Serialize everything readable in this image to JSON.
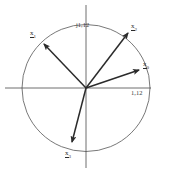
{
  "figure": {
    "type": "vector diagram on unit circle",
    "stroke_color": "#2b2b2b",
    "circle_color": "#555555",
    "axis_color": "#4a4a4a",
    "background": "#ffffff"
  },
  "geometry": {
    "origin": {
      "x": 86,
      "y": 88
    },
    "radius": 64,
    "x_axis": {
      "x1": 5,
      "y1": 88,
      "x2": 151,
      "y2": 88
    },
    "y_axis": {
      "x1": 86,
      "y1": 5,
      "x2": 86,
      "y2": 168
    }
  },
  "axis_labels": {
    "top": "j1,12",
    "right": "1,12"
  },
  "vectors": [
    {
      "id": "x0",
      "symbol": "x",
      "subscript": "0",
      "tip": {
        "x": 139,
        "y": 70
      },
      "label_pos": {
        "x": 143,
        "y": 61
      },
      "angle_deg": 18.8,
      "length_rel": 0.88
    },
    {
      "id": "x2",
      "symbol": "x",
      "subscript": "2",
      "tip": {
        "x": 128,
        "y": 33
      },
      "label_pos": {
        "x": 131,
        "y": 23
      },
      "angle_deg": 52.7,
      "length_rel": 1.12
    },
    {
      "id": "x1",
      "symbol": "x",
      "subscript": "1",
      "tip": {
        "x": 44,
        "y": 44
      },
      "label_pos": {
        "x": 30,
        "y": 30
      },
      "angle_deg": 136.5,
      "length_rel": 0.93
    },
    {
      "id": "x3",
      "symbol": "x",
      "subscript": "3",
      "tip": {
        "x": 72,
        "y": 142
      },
      "label_pos": {
        "x": 65,
        "y": 150
      },
      "angle_deg": 255.1,
      "length_rel": 0.86
    }
  ]
}
